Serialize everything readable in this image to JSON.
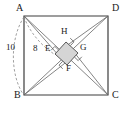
{
  "figure": {
    "type": "geometry-diagram",
    "colors": {
      "stroke": "#555555",
      "outline": "#3d3d3d",
      "inner_fill": "#d5d5d5",
      "dashed": "#777777",
      "text": "#1a1a1a",
      "background": "#ffffff"
    },
    "outer_square": {
      "name": "ABCD",
      "vertices": [
        {
          "id": "A",
          "label": "A",
          "x": 24,
          "y": 16,
          "label_x": 16,
          "label_y": 6
        },
        {
          "id": "D",
          "label": "D",
          "x": 108,
          "y": 16,
          "label_x": 112,
          "label_y": 6
        },
        {
          "id": "B",
          "label": "B",
          "x": 24,
          "y": 95,
          "label_x": 14,
          "label_y": 94
        },
        {
          "id": "C",
          "label": "C",
          "x": 108,
          "y": 95,
          "label_x": 112,
          "label_y": 94
        }
      ]
    },
    "inner_square": {
      "name": "EFGH",
      "vertices": [
        {
          "id": "H",
          "label": "H",
          "x": 66,
          "y": 42,
          "label_x": 61,
          "label_y": 28
        },
        {
          "id": "G",
          "label": "G",
          "x": 78,
          "y": 53,
          "label_x": 80,
          "label_y": 43
        },
        {
          "id": "F",
          "label": "F",
          "x": 67,
          "y": 65,
          "label_x": 66,
          "label_y": 64
        },
        {
          "id": "E",
          "label": "E",
          "x": 55,
          "y": 54,
          "label_x": 45,
          "label_y": 43
        }
      ]
    },
    "measurements": [
      {
        "id": "len-10",
        "label": "10",
        "x": 6,
        "y": 47
      },
      {
        "id": "len-8",
        "label": "8",
        "x": 32,
        "y": 45
      }
    ],
    "right_angle_marks": [
      {
        "at": "H"
      },
      {
        "at": "G"
      },
      {
        "at": "F"
      },
      {
        "at": "E"
      }
    ]
  }
}
